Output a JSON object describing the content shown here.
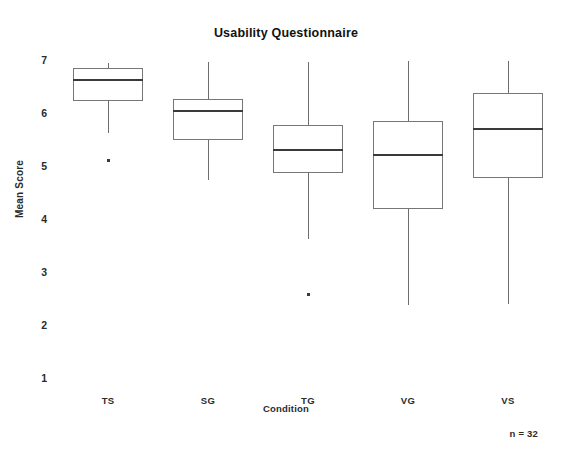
{
  "chart_data": {
    "type": "box",
    "title": "Usability Questionnaire",
    "xlabel": "Condition",
    "ylabel": "Mean Score",
    "ylim": [
      1,
      7
    ],
    "yticks": [
      1,
      2,
      3,
      4,
      5,
      6,
      7
    ],
    "grid": false,
    "legend": "none",
    "annotation": "n = 32",
    "categories": [
      "TS",
      "SG",
      "TG",
      "VG",
      "VS"
    ],
    "boxes": [
      {
        "category": "TS",
        "whisker_high": 6.95,
        "q3": 6.85,
        "median": 6.63,
        "q1": 6.22,
        "whisker_low": 5.63,
        "outliers": [
          5.1
        ]
      },
      {
        "category": "SG",
        "whisker_high": 6.96,
        "q3": 6.27,
        "median": 6.03,
        "q1": 5.49,
        "whisker_low": 4.73,
        "outliers": []
      },
      {
        "category": "TG",
        "whisker_high": 6.96,
        "q3": 5.78,
        "median": 5.3,
        "q1": 4.87,
        "whisker_low": 3.63,
        "outliers": [
          2.57
        ]
      },
      {
        "category": "VG",
        "whisker_high": 6.98,
        "q3": 5.85,
        "median": 5.2,
        "q1": 4.18,
        "whisker_low": 2.37,
        "outliers": []
      },
      {
        "category": "VS",
        "whisker_high": 6.98,
        "q3": 6.37,
        "median": 5.7,
        "q1": 4.77,
        "whisker_low": 2.39,
        "outliers": []
      }
    ]
  },
  "axis": {
    "y_tick_labels": [
      "7",
      "6",
      "5",
      "4",
      "3",
      "2",
      "1"
    ]
  }
}
